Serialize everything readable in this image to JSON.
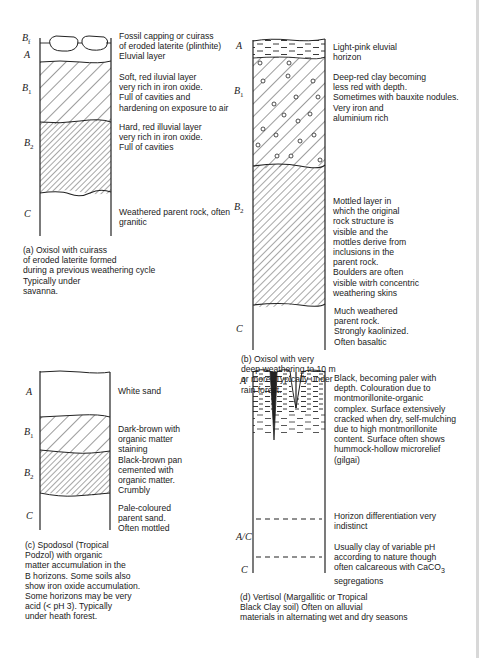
{
  "panels": {
    "a": {
      "horizons": [
        {
          "label": "B",
          "sub": "f",
          "description": [
            "Fossil capping or cuirass",
            "of eroded laterite (plinthite)"
          ]
        },
        {
          "label": "A",
          "sub": "",
          "description": [
            "Eluvial layer"
          ]
        },
        {
          "label": "B",
          "sub": "1",
          "description": [
            "Soft, red iluvial layer",
            "very rich in iron oxide.",
            "Full of cavities and",
            "hardening on exposure to air"
          ]
        },
        {
          "label": "B",
          "sub": "2",
          "description": [
            "Hard, red illuvial layer",
            "very rich in iron oxide.",
            "Full of cavities"
          ]
        },
        {
          "label": "C",
          "sub": "",
          "description": [
            "Weathered parent rock, often",
            "granitic"
          ]
        }
      ],
      "caption": [
        "(a) Oxisol with cuirass",
        "of eroded laterite formed",
        "during a previous weathering cycle",
        "Typically under",
        "savanna."
      ]
    },
    "b": {
      "horizons": [
        {
          "label": "A",
          "sub": "",
          "description": [
            "Light-pink eluvial",
            "horizon"
          ]
        },
        {
          "label": "B",
          "sub": "1",
          "description": [
            "Deep-red clay becoming",
            "less red with depth.",
            "Sometimes with bauxite nodules.",
            "Very iron and",
            "aluminium rich"
          ]
        },
        {
          "label": "B",
          "sub": "2",
          "description": [
            "Mottled layer in",
            "which the original",
            "rock structure is",
            "visible and the",
            "mottles derive from",
            "inclusions in the",
            "parent rock.",
            "Boulders are often",
            "visible witrh concentric",
            "weathering skins"
          ]
        },
        {
          "label": "C",
          "sub": "",
          "description": [
            "Much weathered",
            "parent rock.",
            "Strongly kaolinized.",
            "Often basaltic"
          ]
        }
      ],
      "caption": [
        "(b) Oxisol with very",
        "deep weathering to 10 m",
        "or more. Typically under",
        "rain forest."
      ]
    },
    "c": {
      "horizons": [
        {
          "label": "A",
          "sub": "",
          "description": [
            "White sand"
          ]
        },
        {
          "label": "B",
          "sub": "1",
          "description": [
            "Dark-brown with",
            "organic matter",
            "staining"
          ]
        },
        {
          "label": "B",
          "sub": "2",
          "description": [
            "Black-brown pan",
            "cemented with",
            "organic matter.",
            "Crumbly"
          ]
        },
        {
          "label": "C",
          "sub": "",
          "description": [
            "Pale-coloured",
            "parent sand.",
            "Often mottled"
          ]
        }
      ],
      "caption": [
        "(c) Spodosol (Tropical",
        "Podzol) with organic",
        "matter accumulation in the",
        "B horizons. Some soils also",
        "show iron oxide accumulation.",
        "Some horizons may be very",
        "acid (< pH 3). Typically",
        "under heath forest."
      ]
    },
    "d": {
      "horizons": [
        {
          "label": "A",
          "sub": "",
          "description": [
            "Black, becoming paler with",
            "depth. Colouration due to",
            "montmorillonite-organic",
            "complex. Surface extensively",
            "cracked when dry, self-mulching",
            "due to high montmorillonite",
            "content. Surface often shows",
            "hummock-hollow microrelief",
            "(gilgai)"
          ]
        },
        {
          "label": "A/C",
          "sub": "",
          "description": [
            "Horizon differentiation very",
            "indistinct"
          ]
        },
        {
          "label": "C",
          "sub": "",
          "description": [
            "Usually clay of variable pH",
            "according to nature though",
            "often calcareous with CaCO",
            "segregations"
          ],
          "formula_sub": "3"
        }
      ],
      "caption": [
        "(d) Vertisol (Margallitic or Tropical",
        "Black Clay soil) Often on alluvial",
        "materials in alternating wet and dry seasons"
      ]
    }
  }
}
